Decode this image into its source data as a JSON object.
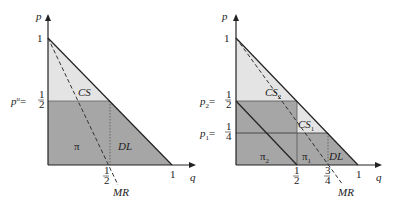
{
  "colors": {
    "light_fill": "#e4e4e4",
    "dark_fill": "#a6a6a6",
    "line": "#222222"
  },
  "left": {
    "axis_p": "p",
    "axis_q": "q",
    "tick_p1": "1",
    "tick_q1": "1",
    "price_label_prefix": "p",
    "price_label_sup": "u",
    "price_label_eq": "=",
    "half_num": "1",
    "half_den": "2",
    "cs": "CS",
    "pi": "π",
    "dl": "DL",
    "mr": "MR"
  },
  "right": {
    "axis_p": "p",
    "axis_q": "q",
    "tick_p1": "1",
    "tick_q1": "1",
    "p2_prefix": "p",
    "p2_sub": "2",
    "p1_prefix": "p",
    "p1_sub": "1",
    "eq": "=",
    "half_num": "1",
    "half_den": "2",
    "quarter_num": "1",
    "quarter_den": "4",
    "threeq_num": "3",
    "threeq_den": "4",
    "cs2": "CS",
    "cs2_sub": "2",
    "cs1": "CS",
    "cs1_sub": "1",
    "pi2": "π",
    "pi2_sub": "2",
    "pi1": "π",
    "pi1_sub": "1",
    "dl": "DL",
    "mr": "MR"
  }
}
